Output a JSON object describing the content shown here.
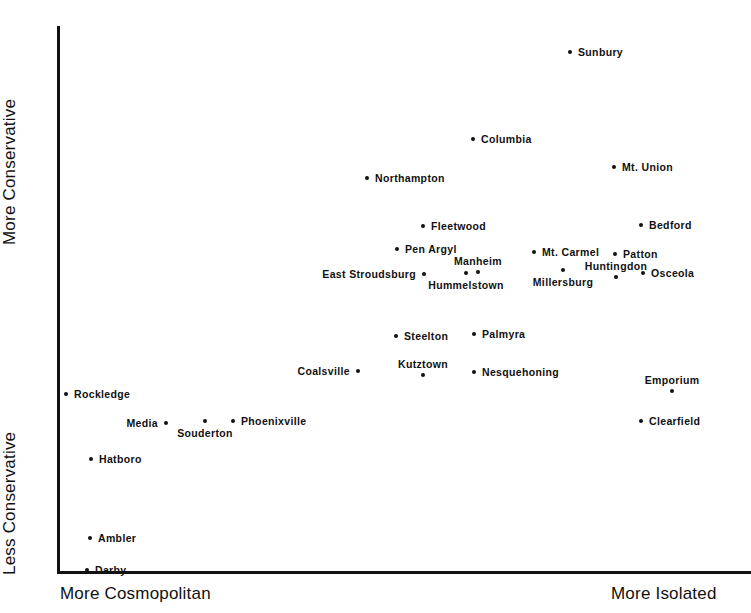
{
  "chart_data": {
    "type": "scatter",
    "title": "",
    "subtitle": "",
    "xlabel": "",
    "ylabel": "",
    "xlabel_left": "More Cosmopolitan",
    "xlabel_right": "More Isolated",
    "ylabel_top": "More Conservative",
    "ylabel_bottom": "Less Conservative",
    "grid": false,
    "legend": false,
    "xlim": [
      0,
      100
    ],
    "ylim": [
      0,
      100
    ],
    "axis_color": "#111111",
    "point_color": "#111111",
    "x_axis_description": "More Cosmopolitan (left) to More Isolated (right)",
    "y_axis_description": "Less Conservative (bottom) to More Conservative (top)",
    "points": [
      {
        "name": "Sunbury",
        "px": 570,
        "py": 52,
        "x": 73.9,
        "y": 95.1,
        "label_pos": "right"
      },
      {
        "name": "Columbia",
        "px": 473,
        "py": 139,
        "x": 59.9,
        "y": 79.2,
        "label_pos": "right"
      },
      {
        "name": "Mt. Union",
        "px": 614,
        "py": 167,
        "x": 80.3,
        "y": 74.1,
        "label_pos": "right"
      },
      {
        "name": "Northampton",
        "px": 367,
        "py": 178,
        "x": 44.7,
        "y": 72.1,
        "label_pos": "right"
      },
      {
        "name": "Bedford",
        "px": 641,
        "py": 225,
        "x": 84.1,
        "y": 63.5,
        "label_pos": "right"
      },
      {
        "name": "Fleetwood",
        "px": 423,
        "py": 226,
        "x": 52.7,
        "y": 63.3,
        "label_pos": "right"
      },
      {
        "name": "Pen Argyl",
        "px": 397,
        "py": 249,
        "x": 49.0,
        "y": 59.1,
        "label_pos": "right"
      },
      {
        "name": "Mt. Carmel",
        "px": 534,
        "py": 252,
        "x": 68.7,
        "y": 58.6,
        "label_pos": "right"
      },
      {
        "name": "Patton",
        "px": 615,
        "py": 254,
        "x": 80.4,
        "y": 58.2,
        "label_pos": "right"
      },
      {
        "name": "East Stroudsburg",
        "px": 424,
        "py": 274,
        "x": 52.9,
        "y": 54.6,
        "label_pos": "left"
      },
      {
        "name": "Manheim",
        "px": 478,
        "py": 272,
        "x": 60.6,
        "y": 54.9,
        "label_pos": "above"
      },
      {
        "name": "Hummelstown",
        "px": 466,
        "py": 273,
        "x": 58.9,
        "y": 54.8,
        "label_pos": "below"
      },
      {
        "name": "Millersburg",
        "px": 563,
        "py": 270,
        "x": 72.9,
        "y": 55.3,
        "label_pos": "below"
      },
      {
        "name": "Huntingdon",
        "px": 616,
        "py": 277,
        "x": 80.5,
        "y": 54.1,
        "label_pos": "above"
      },
      {
        "name": "Osceola",
        "px": 643,
        "py": 273,
        "x": 84.4,
        "y": 54.8,
        "label_pos": "right"
      },
      {
        "name": "Steelton",
        "px": 396,
        "py": 336,
        "x": 48.8,
        "y": 43.2,
        "label_pos": "right"
      },
      {
        "name": "Palmyra",
        "px": 474,
        "py": 334,
        "x": 60.1,
        "y": 43.6,
        "label_pos": "right"
      },
      {
        "name": "Kutztown",
        "px": 423,
        "py": 375,
        "x": 52.7,
        "y": 36.1,
        "label_pos": "above"
      },
      {
        "name": "Coalsville",
        "px": 358,
        "py": 371,
        "x": 43.4,
        "y": 36.9,
        "label_pos": "left"
      },
      {
        "name": "Nesquehoning",
        "px": 474,
        "py": 372,
        "x": 60.1,
        "y": 36.7,
        "label_pos": "right"
      },
      {
        "name": "Emporium",
        "px": 672,
        "py": 391,
        "x": 88.6,
        "y": 33.2,
        "label_pos": "above"
      },
      {
        "name": "Rockledge",
        "px": 66,
        "py": 394,
        "x": 1.3,
        "y": 32.7,
        "label_pos": "right"
      },
      {
        "name": "Clearfield",
        "px": 641,
        "py": 421,
        "x": 84.1,
        "y": 27.8,
        "label_pos": "right"
      },
      {
        "name": "Phoenixville",
        "px": 233,
        "py": 421,
        "x": 25.4,
        "y": 27.8,
        "label_pos": "right"
      },
      {
        "name": "Media",
        "px": 166,
        "py": 423,
        "x": 15.7,
        "y": 27.4,
        "label_pos": "left"
      },
      {
        "name": "Souderton",
        "px": 205,
        "py": 421,
        "x": 21.3,
        "y": 27.8,
        "label_pos": "below"
      },
      {
        "name": "Hatboro",
        "px": 91,
        "py": 459,
        "x": 4.9,
        "y": 20.8,
        "label_pos": "right"
      },
      {
        "name": "Ambler",
        "px": 90,
        "py": 538,
        "x": 4.8,
        "y": 6.4,
        "label_pos": "right"
      },
      {
        "name": "Darby",
        "px": 87,
        "py": 570,
        "x": 4.3,
        "y": 0.5,
        "label_pos": "right"
      }
    ]
  }
}
